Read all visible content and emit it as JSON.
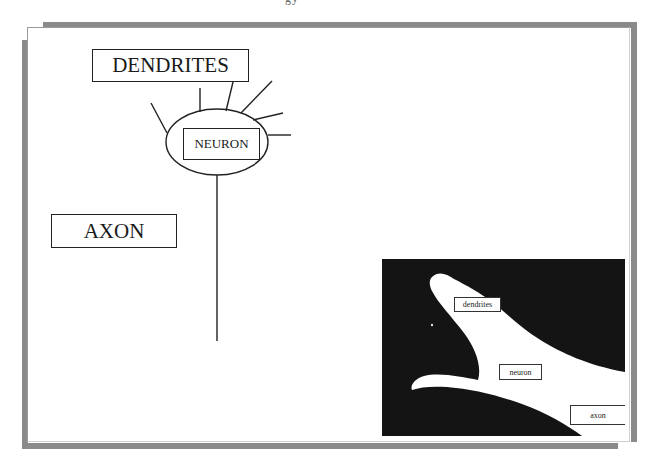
{
  "page": {
    "header_fragment": "gy"
  },
  "diagram": {
    "title_labels": {
      "dendrites": "DENDRITES",
      "neuron": "NEURON",
      "axon": "AXON"
    },
    "parts": [
      {
        "id": "cell-body",
        "shape": "ellipse",
        "label": "NEURON"
      },
      {
        "id": "dendrites",
        "shape": "lines",
        "count": 6,
        "label": "DENDRITES"
      },
      {
        "id": "axon",
        "shape": "line",
        "label": "AXON"
      }
    ],
    "colors": {
      "stroke": "#222222",
      "frame_shadow": "#8a8a8a",
      "photo_background": "#141414",
      "photo_cell": "#ffffff"
    }
  },
  "photo": {
    "description": "micrograph of neuron",
    "labels": {
      "dendrites": "dendrites",
      "neuron": "neuron",
      "axon": "axon"
    }
  }
}
